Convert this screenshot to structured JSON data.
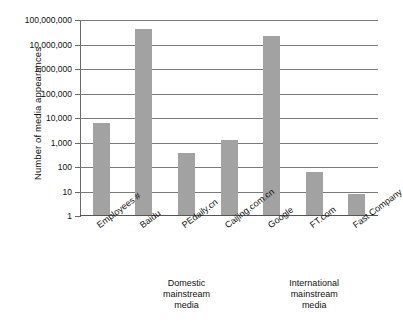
{
  "chart_data": {
    "type": "bar",
    "title": "",
    "subtitle": "",
    "xlabel": "",
    "ylabel": "Number of media appearances",
    "yscale": "log",
    "ylim": [
      1,
      100000000
    ],
    "grid": true,
    "legend": "none",
    "categories": [
      "Employees #",
      "Baidu",
      "PEdaily.cn",
      "Caijing.com.cn",
      "Google",
      "FT.com",
      "Fast Company"
    ],
    "values": [
      6000,
      42000000,
      380,
      1300,
      22000000,
      62,
      8
    ],
    "ytick_labels": [
      "100,000,000",
      "10,000,000",
      "1,000,000",
      "100,000",
      "10,000",
      "1,000",
      "100",
      "10",
      "1"
    ],
    "ytick_values": [
      100000000,
      10000000,
      1000000,
      100000,
      10000,
      1000,
      100,
      10,
      1
    ],
    "bar_color": "#a2a2a2",
    "gridline_color": "#7a7a7a",
    "axis_color": "#6a6a6a",
    "annotations": [
      {
        "name": "domestic-mainstream-media",
        "text": "Domestic\nmainstream\nmedia",
        "spans_categories": [
          "Baidu",
          "PEdaily.cn",
          "Caijing.com.cn"
        ]
      },
      {
        "name": "international-mainstream-media",
        "text": "International\nmainstream\nmedia",
        "spans_categories": [
          "Google",
          "FT.com",
          "Fast Company"
        ]
      }
    ]
  }
}
